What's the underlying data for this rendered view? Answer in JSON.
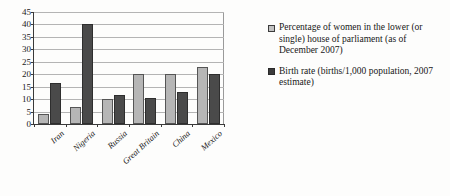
{
  "chart_data": {
    "type": "bar",
    "title": "",
    "xlabel": "",
    "ylabel": "",
    "ylim": [
      0,
      45
    ],
    "ytick_step": 5,
    "yticks": [
      0,
      5,
      10,
      15,
      20,
      25,
      30,
      35,
      40,
      45
    ],
    "grid": true,
    "legend_position": "right",
    "categories": [
      "Iran",
      "Nigeria",
      "Russia",
      "Great Britain",
      "China",
      "Mexico"
    ],
    "series": [
      {
        "name": "Percentage of women in the lower (or single) house of parliament (as of December 2007)",
        "color": "#b6b6b6",
        "values": [
          4,
          7,
          10,
          20,
          20,
          23
        ]
      },
      {
        "name": "Birth rate (births/1,000 population, 2007 estimate)",
        "color": "#4a4a4a",
        "values": [
          16.5,
          40,
          11.5,
          10.5,
          13,
          20
        ]
      }
    ]
  },
  "legend": {
    "entries": [
      {
        "swatch": "light-gray-square",
        "label": "Percentage of women in the lower (or single) house of parliament (as of December 2007)"
      },
      {
        "swatch": "dark-gray-square",
        "label": "Birth rate (births/1,000 population, 2007 estimate)"
      }
    ]
  }
}
